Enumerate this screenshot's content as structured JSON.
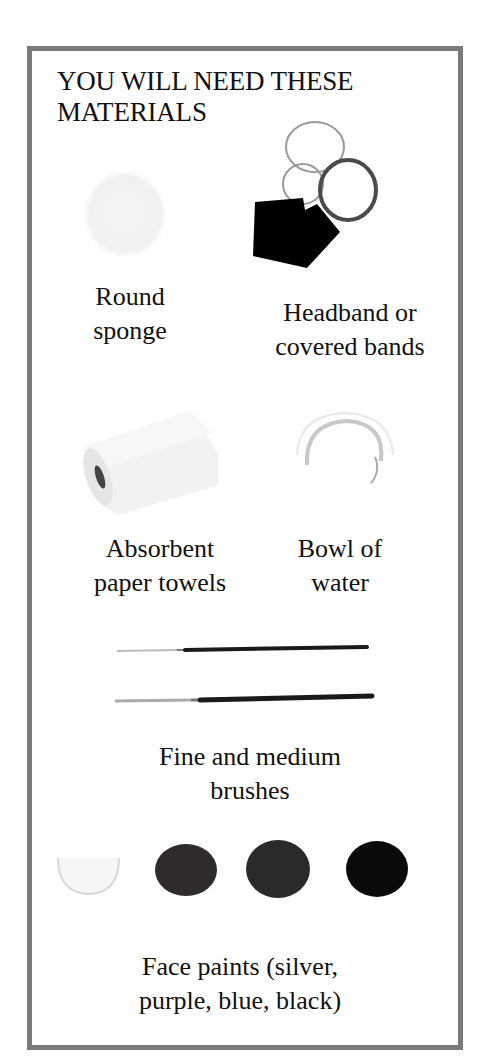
{
  "title": "YOU WILL NEED THESE MATERIALS",
  "items": [
    {
      "name": "round-sponge",
      "label": "Round sponge",
      "line1": "Round",
      "line2": "sponge"
    },
    {
      "name": "headband",
      "label": "Headband or covered bands",
      "line1": "Headband or",
      "line2": "covered bands"
    },
    {
      "name": "paper-towels",
      "label": "Absorbent paper towels",
      "line1": "Absorbent",
      "line2": "paper towels"
    },
    {
      "name": "bowl-of-water",
      "label": "Bowl of water",
      "line1": "Bowl of",
      "line2": "water"
    },
    {
      "name": "brushes",
      "label": "Fine and medium brushes",
      "line1": "Fine and medium",
      "line2": "brushes"
    },
    {
      "name": "face-paints",
      "label": "Face paints (silver, purple, blue, black)",
      "line1": "Face paints (silver,",
      "line2": "purple, blue, black)"
    }
  ],
  "paint_colors": {
    "silver": "#f0f0f0",
    "purple": "#2e2a2e",
    "blue": "#2a2a2c",
    "black": "#0a0a0a"
  },
  "frame_color": "#7a7a7a"
}
